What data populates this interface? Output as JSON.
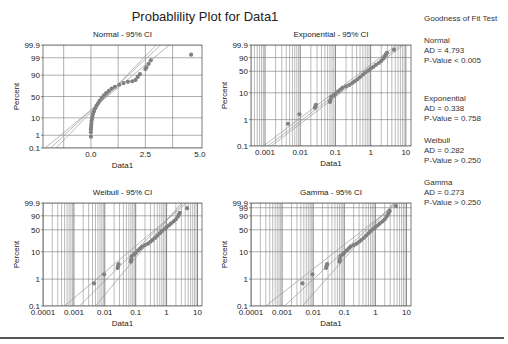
{
  "title": "Probablility Plot for Data1",
  "gof": {
    "heading": "Goodness of Fit Test",
    "entries": [
      {
        "name": "Normal",
        "ad": "AD = 4.793",
        "p": "P-Value < 0.005"
      },
      {
        "name": "Exponential",
        "ad": "AD = 0.338",
        "p": "P-Value = 0.758"
      },
      {
        "name": "Weibull",
        "ad": "AD = 0.282",
        "p": "P-Value > 0.250"
      },
      {
        "name": "Gamma",
        "ad": "AD = 0.273",
        "p": "P-Value > 0.250"
      }
    ]
  },
  "colors": {
    "points": "#808080",
    "lines": "#999999",
    "grid": "#777777",
    "frame": "#444444",
    "text": "#222222"
  },
  "chart_data": [
    {
      "type": "scatter",
      "title": "Normal - 95% CI",
      "xlabel": "Data1",
      "ylabel": "Percent",
      "xscale": "linear",
      "xlim": [
        -2.2,
        5.1
      ],
      "xticks": [
        0.0,
        2.5,
        5.0
      ],
      "xtick_labels": [
        "0.0",
        "2.5",
        "5.0"
      ],
      "xgrid": [
        -1.25,
        0.0,
        1.25,
        2.5,
        3.75
      ],
      "yticks": [
        0.1,
        1,
        10,
        50,
        90,
        99,
        99.9
      ],
      "ytick_labels": [
        "0.1",
        "1",
        "10",
        "50",
        "90",
        "99",
        "99.9"
      ],
      "frame": {
        "x": 43,
        "y": 45,
        "w": 159,
        "h": 103
      },
      "points": [
        [
          0.0,
          0.8
        ],
        [
          0.0,
          1.6
        ],
        [
          0.0,
          2.5
        ],
        [
          0.01,
          3.5
        ],
        [
          0.02,
          5
        ],
        [
          0.03,
          7
        ],
        [
          0.05,
          9
        ],
        [
          0.07,
          12
        ],
        [
          0.1,
          15
        ],
        [
          0.14,
          19
        ],
        [
          0.2,
          24
        ],
        [
          0.26,
          29
        ],
        [
          0.33,
          34
        ],
        [
          0.4,
          40
        ],
        [
          0.5,
          47
        ],
        [
          0.6,
          53
        ],
        [
          0.7,
          58
        ],
        [
          0.82,
          63
        ],
        [
          0.95,
          68
        ],
        [
          1.1,
          72
        ],
        [
          1.3,
          76
        ],
        [
          1.5,
          79
        ],
        [
          1.7,
          81
        ],
        [
          1.9,
          82
        ],
        [
          2.05,
          84
        ],
        [
          2.15,
          88
        ],
        [
          2.25,
          91
        ],
        [
          2.5,
          95
        ],
        [
          2.55,
          96
        ],
        [
          2.65,
          97.5
        ],
        [
          2.75,
          98.5
        ],
        [
          4.6,
          99.4
        ]
      ],
      "fit_lines": [
        [
          [
            -2.1,
            0.1
          ],
          [
            3.6,
            99.9
          ]
        ],
        [
          [
            -1.85,
            0.1
          ],
          [
            3.2,
            99.9
          ]
        ],
        [
          [
            -1.6,
            0.1
          ],
          [
            3.0,
            99.9
          ]
        ]
      ]
    },
    {
      "type": "scatter",
      "title": "Exponential - 95% CI",
      "xlabel": "Data1",
      "ylabel": "Percent",
      "xscale": "log",
      "xlim": [
        0.0004,
        14
      ],
      "xticks": [
        0.001,
        0.01,
        0.1,
        1,
        10
      ],
      "xtick_labels": [
        "0.001",
        "0.01",
        "0.1",
        "1",
        "10"
      ],
      "yticks": [
        0.1,
        1,
        10,
        50,
        90,
        99.9
      ],
      "ytick_labels": [
        "0.1",
        "1",
        "10",
        "50",
        "90",
        "99.9"
      ],
      "frame": {
        "x": 251,
        "y": 45,
        "w": 160,
        "h": 101
      },
      "points": [
        [
          0.0045,
          0.7
        ],
        [
          0.0095,
          1.6
        ],
        [
          0.026,
          2.8
        ],
        [
          0.027,
          3.2
        ],
        [
          0.028,
          3.6
        ],
        [
          0.07,
          4.6
        ],
        [
          0.072,
          5.4
        ],
        [
          0.075,
          7
        ],
        [
          0.09,
          8
        ],
        [
          0.1,
          9
        ],
        [
          0.12,
          11
        ],
        [
          0.14,
          13
        ],
        [
          0.16,
          15
        ],
        [
          0.2,
          17
        ],
        [
          0.25,
          19
        ],
        [
          0.3,
          22
        ],
        [
          0.35,
          25
        ],
        [
          0.42,
          29
        ],
        [
          0.5,
          34
        ],
        [
          0.6,
          40
        ],
        [
          0.7,
          46
        ],
        [
          0.85,
          52
        ],
        [
          1.0,
          58
        ],
        [
          1.2,
          64
        ],
        [
          1.4,
          70
        ],
        [
          1.7,
          76
        ],
        [
          2.0,
          82
        ],
        [
          2.3,
          88
        ],
        [
          2.5,
          92
        ],
        [
          2.7,
          95
        ],
        [
          2.9,
          97
        ],
        [
          4.6,
          99
        ]
      ],
      "fit_lines": [
        [
          [
            0.0012,
            0.1
          ],
          [
            7,
            99.9
          ]
        ],
        [
          [
            0.0009,
            0.1
          ],
          [
            5.5,
            99.9
          ]
        ],
        [
          [
            0.0015,
            0.1
          ],
          [
            8.5,
            99.9
          ]
        ]
      ]
    },
    {
      "type": "scatter",
      "title": "Weibull - 95% CI",
      "xlabel": "Data1",
      "ylabel": "Percent",
      "xscale": "log",
      "xlim": [
        0.0001,
        14
      ],
      "xticks": [
        0.0001,
        0.001,
        0.01,
        0.1,
        1,
        10
      ],
      "xtick_labels": [
        "0.0001",
        "0.001",
        "0.01",
        "0.1",
        "1",
        "10"
      ],
      "yticks": [
        0.1,
        1,
        10,
        50,
        90,
        99.9
      ],
      "ytick_labels": [
        "0.1",
        "1",
        "10",
        "50",
        "90",
        "99.9"
      ],
      "frame": {
        "x": 43,
        "y": 203,
        "w": 159,
        "h": 103
      },
      "points": [
        [
          0.0045,
          0.7
        ],
        [
          0.0095,
          1.5
        ],
        [
          0.026,
          2.6
        ],
        [
          0.027,
          3.1
        ],
        [
          0.028,
          3.6
        ],
        [
          0.07,
          4.4
        ],
        [
          0.072,
          5.4
        ],
        [
          0.075,
          7
        ],
        [
          0.09,
          8
        ],
        [
          0.1,
          9
        ],
        [
          0.12,
          11
        ],
        [
          0.14,
          13
        ],
        [
          0.16,
          15
        ],
        [
          0.2,
          17
        ],
        [
          0.25,
          19
        ],
        [
          0.3,
          22
        ],
        [
          0.35,
          25
        ],
        [
          0.42,
          29
        ],
        [
          0.5,
          34
        ],
        [
          0.6,
          40
        ],
        [
          0.7,
          46
        ],
        [
          0.85,
          52
        ],
        [
          1.0,
          58
        ],
        [
          1.2,
          64
        ],
        [
          1.4,
          70
        ],
        [
          1.7,
          76
        ],
        [
          2.0,
          82
        ],
        [
          2.3,
          88
        ],
        [
          2.5,
          92
        ],
        [
          2.7,
          95
        ],
        [
          4.6,
          98.8
        ]
      ],
      "fit_lines": [
        [
          [
            0.0005,
            0.1
          ],
          [
            4.5,
            99.9
          ]
        ],
        [
          [
            0.0015,
            0.1
          ],
          [
            3.6,
            99.9
          ]
        ],
        [
          [
            0.005,
            0.1
          ],
          [
            3.0,
            99.9
          ]
        ]
      ]
    },
    {
      "type": "scatter",
      "title": "Gamma - 95% CI",
      "xlabel": "Data1",
      "ylabel": "Percent",
      "xscale": "log",
      "xlim": [
        0.0001,
        14
      ],
      "xticks": [
        0.0001,
        0.001,
        0.01,
        0.1,
        1,
        10
      ],
      "xtick_labels": [
        "0.0001",
        "0.001",
        "0.01",
        "0.1",
        "1",
        "10"
      ],
      "yticks": [
        0.1,
        1,
        10,
        50,
        90,
        99,
        99.9
      ],
      "ytick_labels": [
        "0.1",
        "1",
        "10",
        "50",
        "90",
        "99",
        "99.9"
      ],
      "frame": {
        "x": 251,
        "y": 203,
        "w": 160,
        "h": 103
      },
      "points": [
        [
          0.0045,
          0.7
        ],
        [
          0.0095,
          1.5
        ],
        [
          0.026,
          2.6
        ],
        [
          0.027,
          3.1
        ],
        [
          0.028,
          3.6
        ],
        [
          0.07,
          4.4
        ],
        [
          0.072,
          5.4
        ],
        [
          0.075,
          7
        ],
        [
          0.09,
          8
        ],
        [
          0.1,
          9
        ],
        [
          0.12,
          11
        ],
        [
          0.14,
          13
        ],
        [
          0.16,
          15
        ],
        [
          0.2,
          17
        ],
        [
          0.25,
          19
        ],
        [
          0.3,
          22
        ],
        [
          0.35,
          25
        ],
        [
          0.42,
          29
        ],
        [
          0.5,
          34
        ],
        [
          0.6,
          40
        ],
        [
          0.7,
          46
        ],
        [
          0.85,
          52
        ],
        [
          1.0,
          58
        ],
        [
          1.2,
          64
        ],
        [
          1.4,
          70
        ],
        [
          1.7,
          76
        ],
        [
          2.0,
          82
        ],
        [
          2.3,
          88
        ],
        [
          2.5,
          92
        ],
        [
          2.7,
          95
        ],
        [
          2.9,
          97
        ],
        [
          4.6,
          99.5
        ]
      ],
      "fit_lines": [
        [
          [
            0.0003,
            0.1
          ],
          [
            5.2,
            99.9
          ]
        ],
        [
          [
            0.0012,
            0.1
          ],
          [
            4.4,
            99.9
          ]
        ],
        [
          [
            0.0045,
            0.1
          ],
          [
            3.9,
            99.9
          ]
        ]
      ]
    }
  ]
}
